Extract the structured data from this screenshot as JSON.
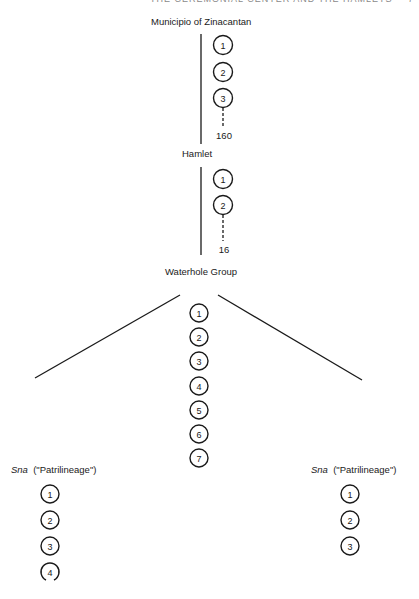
{
  "page": {
    "running_header": "THE CEREMONIAL CENTER AND THE HAMLETS",
    "page_number": "7"
  },
  "levels": {
    "municipio": {
      "label": "Municipio of Zinacantan",
      "units": [
        "1",
        "2",
        "3"
      ],
      "total": "160"
    },
    "hamlet": {
      "label": "Hamlet",
      "units": [
        "1",
        "2"
      ],
      "total": "16"
    },
    "waterhole_group": {
      "label": "Waterhole Group",
      "units": [
        "1",
        "2",
        "3",
        "4",
        "5",
        "6",
        "7"
      ]
    },
    "sna_left": {
      "label_italic": "Sna",
      "label_rest": "(\"Patrilineage\")",
      "units": [
        "1",
        "2",
        "3",
        "4"
      ]
    },
    "sna_right": {
      "label_italic": "Sna",
      "label_rest": "(\"Patrilineage\")",
      "units": [
        "1",
        "2",
        "3"
      ]
    }
  },
  "colors": {
    "ink": "#1a1a1a",
    "background": "#ffffff"
  }
}
